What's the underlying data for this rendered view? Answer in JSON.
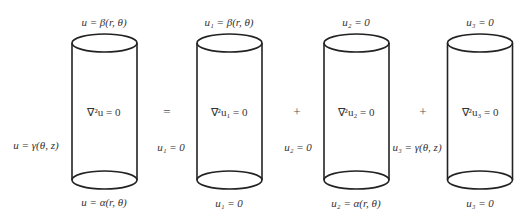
{
  "diagram": {
    "cylinders": [
      {
        "id": "original",
        "top": "u = β(r, θ)",
        "interior": "∇²u = 0",
        "side": "u = γ(θ, z)",
        "bottom": "u = α(r, θ)"
      },
      {
        "id": "u1",
        "top": "u₁ = β(r, θ)",
        "interior": "∇²u₁ = 0",
        "side": "u₁ = 0",
        "bottom": "u₁ = 0"
      },
      {
        "id": "u2",
        "top": "u₂ = 0",
        "interior": "∇²u₂ = 0",
        "side": "u₂ = 0",
        "bottom": "u₂ = α(r, θ)"
      },
      {
        "id": "u3",
        "top": "u₃ = 0",
        "interior": "∇²u₃ = 0",
        "side": "u₃ = γ(θ, z)",
        "bottom": "u₃ = 0"
      }
    ],
    "operators": [
      "=",
      "+",
      "+"
    ],
    "colors": {
      "stroke": "#222222",
      "text": "#333333",
      "background": "#ffffff"
    }
  }
}
